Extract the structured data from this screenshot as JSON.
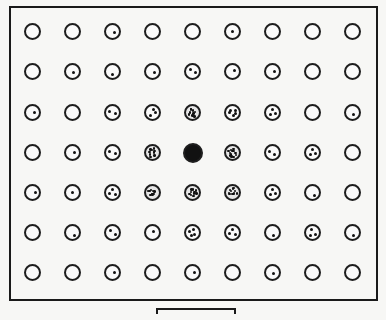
{
  "diagram": {
    "type": "dot-grid",
    "rows": 7,
    "cols": 9,
    "col_x": [
      33,
      73,
      113,
      153,
      193,
      233,
      273,
      313,
      353
    ],
    "row_y": [
      32,
      72,
      113,
      153,
      193,
      233,
      273
    ],
    "center_cell": {
      "row": 3,
      "col": 4,
      "state": "filled"
    },
    "dot_counts": [
      [
        0,
        0,
        1,
        0,
        0,
        1,
        0,
        0,
        0
      ],
      [
        0,
        1,
        1,
        1,
        2,
        1,
        1,
        0,
        0
      ],
      [
        1,
        0,
        2,
        3,
        9,
        5,
        3,
        0,
        1
      ],
      [
        0,
        1,
        2,
        9,
        -1,
        12,
        2,
        3,
        0
      ],
      [
        1,
        1,
        3,
        9,
        10,
        12,
        3,
        1,
        0
      ],
      [
        0,
        1,
        2,
        1,
        4,
        3,
        1,
        3,
        1
      ],
      [
        0,
        0,
        1,
        0,
        1,
        0,
        1,
        0,
        0
      ]
    ],
    "legend": "-1 = solid filled circle",
    "colors": {
      "ink": "#111111",
      "paper": "#f7f7f5"
    },
    "scale_bar": {
      "visible": true
    }
  }
}
